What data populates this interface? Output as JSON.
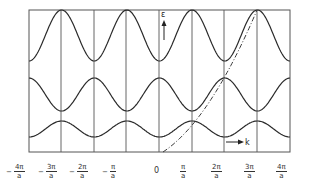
{
  "diagram": {
    "type": "band-structure",
    "y_axis_label": "ε",
    "x_axis_label": "k",
    "frame": {
      "left": 29,
      "top": 10,
      "right": 290,
      "bottom": 152
    },
    "zone_boundaries_x": [
      61,
      94,
      126,
      159,
      192,
      224,
      257
    ],
    "colors": {
      "curve": "#2b2b2b",
      "grid": "#555555",
      "free_electron": "#3a3a3a"
    },
    "bands": [
      {
        "name": "band-3-top",
        "max_y": 10,
        "min_y": 61,
        "max_at": "odd"
      },
      {
        "name": "band-2-middle",
        "max_y": 78,
        "min_y": 111,
        "max_at": "even"
      },
      {
        "name": "band-1-bottom",
        "max_y": 121,
        "min_y": 137,
        "max_at": "odd"
      }
    ],
    "free_electron_curve": {
      "style": "dash-dot",
      "points": [
        [
          163,
          152
        ],
        [
          192,
          121
        ],
        [
          224,
          78
        ],
        [
          257,
          10
        ]
      ]
    }
  },
  "x_ticks": [
    {
      "sign": "−",
      "num": "4π",
      "den": "a",
      "x": 20
    },
    {
      "sign": "−",
      "num": "3π",
      "den": "a",
      "x": 52
    },
    {
      "sign": "−",
      "num": "2π",
      "den": "a",
      "x": 83
    },
    {
      "sign": "−",
      "num": "π",
      "den": "a",
      "x": 116
    },
    {
      "sign": "",
      "num": "0",
      "den": "",
      "x": 157
    },
    {
      "sign": "",
      "num": "π",
      "den": "a",
      "x": 187
    },
    {
      "sign": "",
      "num": "2π",
      "den": "a",
      "x": 218
    },
    {
      "sign": "",
      "num": "3π",
      "den": "a",
      "x": 251
    },
    {
      "sign": "",
      "num": "4π",
      "den": "a",
      "x": 283
    }
  ]
}
